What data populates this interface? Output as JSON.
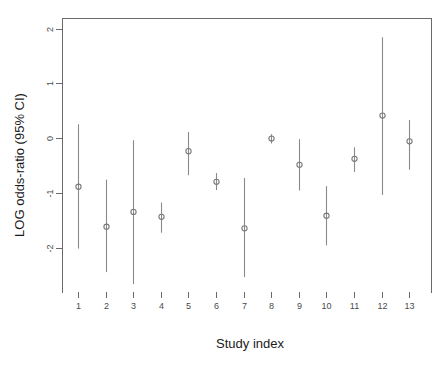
{
  "chart_data": {
    "type": "scatter",
    "title": "",
    "subtitle": "",
    "xlabel": "Study index",
    "ylabel": "LOG odds-ratio (95% CI)",
    "grid": false,
    "legend": "none",
    "xlim": [
      0.4,
      13.6
    ],
    "ylim": [
      -2.75,
      2.05
    ],
    "x_ticks": [
      1,
      2,
      3,
      4,
      5,
      6,
      7,
      8,
      9,
      10,
      11,
      12,
      13
    ],
    "x_tick_labels": [
      "1",
      "2",
      "3",
      "4",
      "5",
      "6",
      "7",
      "8",
      "9",
      "10",
      "11",
      "12",
      "13"
    ],
    "y_ticks": [
      -2,
      -1,
      0,
      1,
      2
    ],
    "y_tick_labels": [
      "-2",
      "-1",
      "0",
      "1",
      "2"
    ],
    "marker": "open-circle",
    "error_bar_style": "vertical-line-95ci",
    "categories": [
      "1",
      "2",
      "3",
      "4",
      "5",
      "6",
      "7",
      "8",
      "9",
      "10",
      "11",
      "12",
      "13"
    ],
    "x": [
      1,
      2,
      3,
      4,
      5,
      6,
      7,
      8,
      9,
      10,
      11,
      12,
      13
    ],
    "values": [
      -0.89,
      -1.62,
      -1.35,
      -1.44,
      -0.24,
      -0.8,
      -1.65,
      -0.01,
      -0.49,
      -1.42,
      -0.38,
      0.41,
      -0.06
    ],
    "ci_lower": [
      -2.02,
      -2.45,
      -2.67,
      -1.73,
      -0.68,
      -0.95,
      -2.54,
      -0.1,
      -0.96,
      -1.96,
      -0.62,
      -1.04,
      -0.58
    ],
    "ci_upper": [
      0.25,
      -0.76,
      -0.04,
      -1.18,
      0.11,
      -0.64,
      -0.73,
      0.07,
      -0.02,
      -0.88,
      -0.17,
      1.84,
      0.33
    ],
    "series": [
      {
        "name": "LOG odds-ratio (95% CI)",
        "values": [
          -0.89,
          -1.62,
          -1.35,
          -1.44,
          -0.24,
          -0.8,
          -1.65,
          -0.01,
          -0.49,
          -1.42,
          -0.38,
          0.41,
          -0.06
        ]
      }
    ],
    "colors": {
      "marker": "#7a7a7a",
      "line": "#8a8a8a",
      "axis": "#6a6a6a",
      "text": "#1a1a1a",
      "background": "#ffffff"
    }
  }
}
